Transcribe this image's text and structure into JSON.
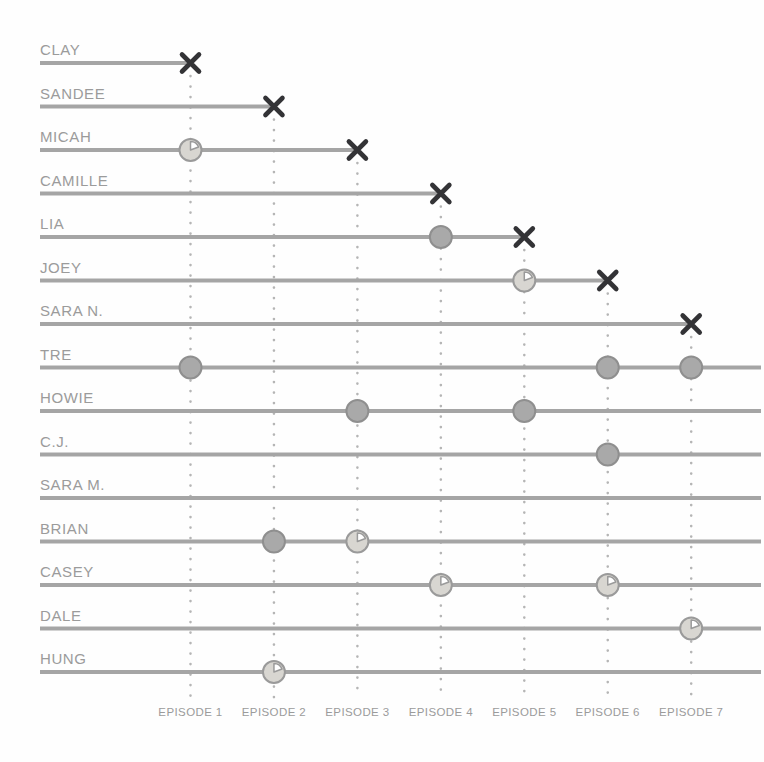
{
  "page": {
    "background": "#fefefe"
  },
  "colors": {
    "bar": "#a5a5a5",
    "name_text": "#9b9b9b",
    "episode_text": "#9b9b9b",
    "x_mark": "#333336",
    "dotted_line": "#b5b5b5",
    "solid_marker_fill": "#a9a9a9",
    "solid_marker_stroke": "#8f8f8f",
    "clock_marker_fill": "#d8d6d1",
    "clock_marker_stroke": "#9a9a9a",
    "clock_marker_wedge": "#ffffff"
  },
  "chart_data": {
    "type": "timeline",
    "title": "",
    "x_categories": [
      "EPISODE 1",
      "EPISODE 2",
      "EPISODE 3",
      "EPISODE 4",
      "EPISODE 5",
      "EPISODE 6",
      "EPISODE 7"
    ],
    "x_axis_note": "vertical dotted gridline drops from each elimination X down to its episode label",
    "marker_kinds": {
      "x": "bar ends with a bold X at the listed episode (contestant eliminated)",
      "solid-circle": "filled gray dot on the bar",
      "pie-clock": "light circle with clock/pie wedge glyph on the bar"
    },
    "rows": [
      {
        "name": "CLAY",
        "end_episode": 1,
        "markers": []
      },
      {
        "name": "SANDEE",
        "end_episode": 2,
        "markers": []
      },
      {
        "name": "MICAH",
        "end_episode": 3,
        "markers": [
          {
            "episode": 1,
            "kind": "pie-clock"
          }
        ]
      },
      {
        "name": "CAMILLE",
        "end_episode": 4,
        "markers": []
      },
      {
        "name": "LIA",
        "end_episode": 5,
        "markers": [
          {
            "episode": 4,
            "kind": "solid-circle"
          }
        ]
      },
      {
        "name": "JOEY",
        "end_episode": 6,
        "markers": [
          {
            "episode": 5,
            "kind": "pie-clock"
          }
        ]
      },
      {
        "name": "SARA N.",
        "end_episode": 7,
        "markers": []
      },
      {
        "name": "TRE",
        "end_episode": null,
        "markers": [
          {
            "episode": 1,
            "kind": "solid-circle"
          },
          {
            "episode": 6,
            "kind": "solid-circle"
          },
          {
            "episode": 7,
            "kind": "solid-circle"
          }
        ]
      },
      {
        "name": "HOWIE",
        "end_episode": null,
        "markers": [
          {
            "episode": 3,
            "kind": "solid-circle"
          },
          {
            "episode": 5,
            "kind": "solid-circle"
          }
        ]
      },
      {
        "name": "C.J.",
        "end_episode": null,
        "markers": [
          {
            "episode": 6,
            "kind": "solid-circle"
          }
        ]
      },
      {
        "name": "SARA M.",
        "end_episode": null,
        "markers": []
      },
      {
        "name": "BRIAN",
        "end_episode": null,
        "markers": [
          {
            "episode": 2,
            "kind": "solid-circle"
          },
          {
            "episode": 3,
            "kind": "pie-clock"
          }
        ]
      },
      {
        "name": "CASEY",
        "end_episode": null,
        "markers": [
          {
            "episode": 4,
            "kind": "pie-clock"
          },
          {
            "episode": 6,
            "kind": "pie-clock"
          }
        ]
      },
      {
        "name": "DALE",
        "end_episode": null,
        "markers": [
          {
            "episode": 7,
            "kind": "pie-clock"
          }
        ]
      },
      {
        "name": "HUNG",
        "end_episode": null,
        "markers": [
          {
            "episode": 2,
            "kind": "pie-clock"
          }
        ]
      }
    ]
  }
}
